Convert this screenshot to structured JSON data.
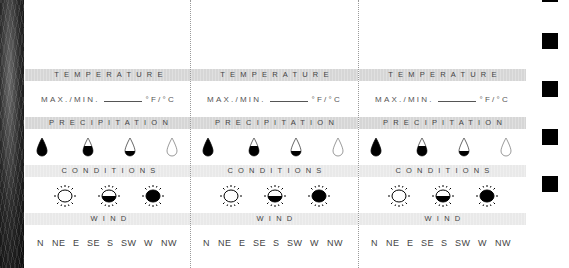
{
  "columns": [
    {
      "temperature_label": "TEMPERATURE",
      "maxmin_label": "MAX./MIN.",
      "unit_label": "°F/°C",
      "precipitation_label": "PRECIPITATION",
      "conditions_label": "CONDITIONS",
      "wind_label": "WIND",
      "wind_directions": [
        "N",
        "NE",
        "E",
        "SE",
        "S",
        "SW",
        "W",
        "NW"
      ]
    },
    {
      "temperature_label": "TEMPERATURE",
      "maxmin_label": "MAX./MIN.",
      "unit_label": "°F/°C",
      "precipitation_label": "PRECIPITATION",
      "conditions_label": "CONDITIONS",
      "wind_label": "WIND",
      "wind_directions": [
        "N",
        "NE",
        "E",
        "SE",
        "S",
        "SW",
        "W",
        "NW"
      ]
    },
    {
      "temperature_label": "TEMPERATURE",
      "maxmin_label": "MAX./MIN.",
      "unit_label": "°F/°C",
      "precipitation_label": "PRECIPITATION",
      "conditions_label": "CONDITIONS",
      "wind_label": "WIND",
      "wind_directions": [
        "N",
        "NE",
        "E",
        "SE",
        "S",
        "SW",
        "W",
        "NW"
      ]
    }
  ],
  "precipitation_icons": [
    "drop-full-icon",
    "drop-two-thirds-icon",
    "drop-one-third-icon",
    "drop-empty-icon"
  ],
  "condition_icons": [
    "sun-clear-icon",
    "sun-half-cloudy-icon",
    "sun-overcast-icon"
  ],
  "colors": {
    "band_dark": "#d6d6d6",
    "band_light": "#e9e9e9",
    "ink": "#000000",
    "text": "#444444"
  }
}
